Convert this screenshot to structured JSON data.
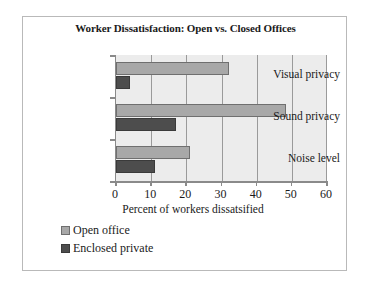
{
  "chart_data": {
    "type": "bar",
    "orientation": "horizontal",
    "title": "Worker Dissatisfaction: Open vs. Closed Offices",
    "xlabel": "Percent of workers dissatsified",
    "ylabel": "",
    "categories": [
      "Visual privacy",
      "Sound privacy",
      "Noise level"
    ],
    "series": [
      {
        "name": "Open office",
        "color": "#a8a8a8",
        "values": [
          32,
          48,
          21
        ]
      },
      {
        "name": "Enclosed private",
        "color": "#4d4d4d",
        "values": [
          4,
          17,
          11
        ]
      }
    ],
    "xlim": [
      0,
      60
    ],
    "xticks": [
      0,
      10,
      20,
      30,
      40,
      50,
      60
    ],
    "xtick_labels": [
      "0",
      "10",
      "20",
      "30",
      "40",
      "50",
      "60"
    ],
    "grid": true,
    "grid_axis": "x",
    "legend_position": "below-left",
    "plot_background": "#ececec",
    "frame_border_color": "#b9b9b9"
  }
}
